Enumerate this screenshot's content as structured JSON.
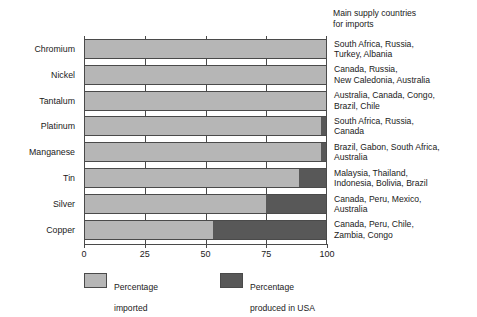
{
  "chart_data": {
    "type": "bar",
    "orientation": "horizontal",
    "stacked": true,
    "title": "",
    "xlabel": "",
    "ylabel": "",
    "xlim": [
      0,
      100
    ],
    "xticks": [
      "0",
      "25",
      "50",
      "75",
      "100"
    ],
    "grid": "vertical gridlines at 25, 50, 75",
    "legend_position": "bottom",
    "categories": [
      "Chromium",
      "Nickel",
      "Tantalum",
      "Platinum",
      "Manganese",
      "Tin",
      "Silver",
      "Copper"
    ],
    "series": [
      {
        "name": "Percentage imported",
        "color": "#b6b6b6",
        "values": [
          100,
          100,
          100,
          98,
          98,
          89,
          75,
          53
        ]
      },
      {
        "name": "Percentage produced in USA",
        "color": "#585858",
        "values": [
          0,
          0,
          0,
          2,
          2,
          11,
          25,
          47
        ]
      }
    ],
    "annotations": {
      "supply_header": "Main supply countries for imports",
      "supply_countries": [
        "South Africa, Russia, Turkey, Albania",
        "Canada, Russia, New Caledonia, Australia",
        "Australia, Canada, Congo, Brazil, Chile",
        "South Africa, Russia, Canada",
        "Brazil, Gabon, South Africa, Australia",
        "Malaysia, Thailand, Indonesia, Bolivia, Brazil",
        "Canada, Peru, Mexico, Australia",
        "Canada, Peru, Chile, Zambia, Congo"
      ]
    }
  },
  "supply": {
    "header_line1": "Main supply countries",
    "header_line2": "for imports",
    "rows": [
      {
        "line1": "South Africa, Russia,",
        "line2": "Turkey, Albania"
      },
      {
        "line1": "Canada, Russia,",
        "line2": "New Caledonia, Australia"
      },
      {
        "line1": "Australia, Canada, Congo,",
        "line2": "Brazil, Chile"
      },
      {
        "line1": "South Africa, Russia,",
        "line2": "Canada"
      },
      {
        "line1": "Brazil, Gabon, South Africa,",
        "line2": "Australia"
      },
      {
        "line1": "Malaysia, Thailand,",
        "line2": "Indonesia, Bolivia, Brazil"
      },
      {
        "line1": "Canada, Peru, Mexico,",
        "line2": "Australia"
      },
      {
        "line1": "Canada, Peru, Chile,",
        "line2": "Zambia, Congo"
      }
    ]
  },
  "axis": {
    "ticks": [
      {
        "label": "0",
        "value": 0
      },
      {
        "label": "25",
        "value": 25
      },
      {
        "label": "50",
        "value": 50
      },
      {
        "label": "75",
        "value": 75
      },
      {
        "label": "100",
        "value": 100
      }
    ]
  },
  "legend": {
    "imported": {
      "line1": "Percentage",
      "line2": "imported",
      "color": "#b6b6b6"
    },
    "usa": {
      "line1": "Percentage",
      "line2": "produced in USA",
      "color": "#585858"
    }
  },
  "colors": {
    "imported": "#b6b6b6",
    "produced_usa": "#585858",
    "outline": "#4a4a4a",
    "text": "#1a1a1a",
    "background": "#ffffff"
  }
}
